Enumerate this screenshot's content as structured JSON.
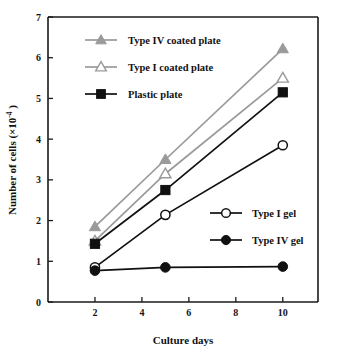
{
  "chart_data": {
    "type": "line",
    "title": "",
    "xlabel": "Culture days",
    "ylabel": "Number of cells (×10⁻⁴)",
    "ylabel_main": "Number of cells (",
    "ylabel_times": "×10",
    "ylabel_exp": "-4",
    "ylabel_close": " )",
    "x": [
      2,
      5,
      10
    ],
    "xlim": [
      0,
      11.5
    ],
    "ylim": [
      0,
      7
    ],
    "xticks": [
      2,
      4,
      6,
      8,
      10
    ],
    "xtick_labels": [
      "2",
      "4",
      "6",
      "8",
      "10"
    ],
    "yticks": [
      0,
      1,
      2,
      3,
      4,
      5,
      6,
      7
    ],
    "ytick_labels": [
      "0",
      "1",
      "2",
      "3",
      "4",
      "5",
      "6",
      "7"
    ],
    "grid": false,
    "legend_position": "inside-upper-left and inside-mid-right",
    "series": [
      {
        "name": "Type IV coated plate",
        "marker": "filled-triangle",
        "color": "#9a9a9a",
        "line_color": "#9a9a9a",
        "values": [
          1.85,
          3.5,
          6.22
        ]
      },
      {
        "name": "Type I coated plate",
        "marker": "open-triangle",
        "color": "#9a9a9a",
        "line_color": "#9a9a9a",
        "values": [
          1.5,
          3.15,
          5.5
        ]
      },
      {
        "name": "Plastic plate",
        "marker": "filled-square",
        "color": "#111111",
        "line_color": "#111111",
        "values": [
          1.43,
          2.75,
          5.15
        ]
      },
      {
        "name": "Type I gel",
        "marker": "open-circle",
        "color": "#111111",
        "line_color": "#111111",
        "values": [
          0.85,
          2.14,
          3.85
        ]
      },
      {
        "name": "Type IV gel",
        "marker": "filled-circle",
        "color": "#111111",
        "line_color": "#111111",
        "values": [
          0.77,
          0.85,
          0.87
        ]
      }
    ]
  },
  "legend": {
    "top": [
      {
        "label": "Type IV coated plate",
        "marker": "filled-triangle",
        "color": "#9a9a9a"
      },
      {
        "label": "Type I coated plate",
        "marker": "open-triangle",
        "color": "#9a9a9a"
      },
      {
        "label": "Plastic plate",
        "marker": "filled-square",
        "color": "#111111"
      }
    ],
    "bottom": [
      {
        "label": "Type I gel",
        "marker": "open-circle",
        "color": "#111111"
      },
      {
        "label": "Type IV gel",
        "marker": "filled-circle",
        "color": "#111111"
      }
    ]
  },
  "colors": {
    "gray_series": "#9a9a9a",
    "black_series": "#111111",
    "axis": "#1a1a1a",
    "background": "#ffffff"
  }
}
